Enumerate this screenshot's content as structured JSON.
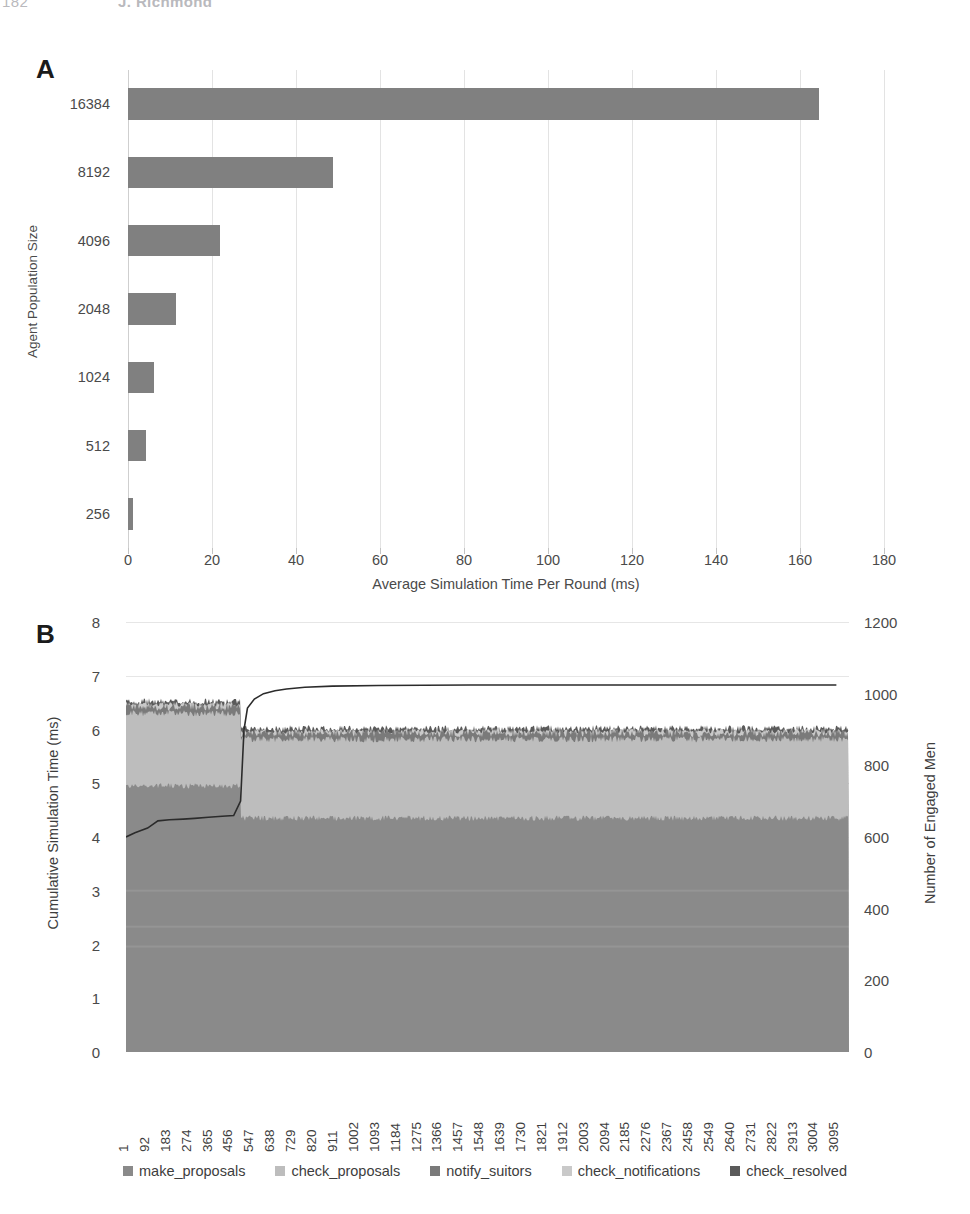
{
  "running_head": {
    "page_number": "182",
    "author": "J. Richmond"
  },
  "figure": {
    "panel_a": {
      "label": "A",
      "chart_data": {
        "type": "bar",
        "orientation": "horizontal",
        "title": "",
        "xlabel": "Average Simulation Time Per Round (ms)",
        "ylabel": "Agent Population Size",
        "categories": [
          "256",
          "512",
          "1024",
          "2048",
          "4096",
          "8192",
          "16384"
        ],
        "values": [
          1.2,
          4.3,
          6.2,
          11.5,
          22.0,
          48.8,
          164.5
        ],
        "xlim": [
          0,
          180
        ],
        "xticks": [
          0,
          20,
          40,
          60,
          80,
          100,
          120,
          140,
          160,
          180
        ],
        "grid": true,
        "legend": "none",
        "bar_color": "#808080"
      }
    },
    "panel_b": {
      "label": "B",
      "chart_data": {
        "type": "area",
        "stacked": true,
        "title": "",
        "xlabel": "",
        "ylabel": "Cumulative Simulation Time (ms)",
        "y2label": "Number of Engaged Men",
        "ylim": [
          0,
          8
        ],
        "yticks": [
          0,
          1,
          2,
          3,
          4,
          5,
          6,
          7,
          8
        ],
        "y2lim": [
          0,
          1200
        ],
        "y2ticks": [
          0,
          200,
          400,
          600,
          800,
          1000,
          1200
        ],
        "grid": true,
        "legend_position": "bottom",
        "xticks": [
          1,
          92,
          183,
          274,
          365,
          456,
          547,
          638,
          729,
          820,
          911,
          1002,
          1093,
          1184,
          1275,
          1366,
          1457,
          1548,
          1639,
          1730,
          1821,
          1912,
          2003,
          2094,
          2185,
          2276,
          2367,
          2458,
          2549,
          2640,
          2731,
          2822,
          2913,
          3004,
          3095
        ],
        "xlim": [
          1,
          3150
        ],
        "series": [
          {
            "name": "make_proposals",
            "color": "#8a8a8a",
            "phase1_top": 4.95,
            "phase2_top": 4.35,
            "noise": 0.05
          },
          {
            "name": "check_proposals",
            "color": "#bdbdbd",
            "phase1_top": 6.3,
            "phase2_top": 5.82,
            "noise": 0.06
          },
          {
            "name": "notify_suitors",
            "color": "#7a7a7a",
            "phase1_top": 6.42,
            "phase2_top": 5.93,
            "noise": 0.07
          },
          {
            "name": "check_notifications",
            "color": "#c9c9c9",
            "phase1_top": 6.47,
            "phase2_top": 5.97,
            "noise": 0.05
          },
          {
            "name": "check_resolved",
            "color": "#5a5a5a",
            "phase1_top": 6.52,
            "phase2_top": 6.02,
            "noise": 0.06
          }
        ],
        "overlay_line": {
          "name": "engaged_men",
          "color": "#2b2b2b",
          "axis": "right",
          "points": [
            [
              1,
              600
            ],
            [
              40,
              612
            ],
            [
              95,
              625
            ],
            [
              140,
              645
            ],
            [
              190,
              648
            ],
            [
              250,
              650
            ],
            [
              300,
              652
            ],
            [
              360,
              655
            ],
            [
              420,
              658
            ],
            [
              470,
              660
            ],
            [
              500,
              700
            ],
            [
              515,
              900
            ],
            [
              530,
              960
            ],
            [
              560,
              985
            ],
            [
              600,
              1000
            ],
            [
              650,
              1008
            ],
            [
              700,
              1013
            ],
            [
              780,
              1018
            ],
            [
              900,
              1021
            ],
            [
              1100,
              1023
            ],
            [
              1500,
              1024
            ],
            [
              2000,
              1024
            ],
            [
              2600,
              1024
            ],
            [
              3095,
              1024
            ]
          ]
        },
        "phase_break_round": 500
      }
    }
  }
}
